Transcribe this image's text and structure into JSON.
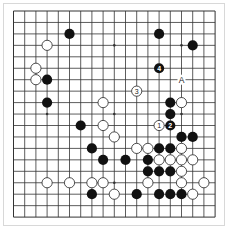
{
  "diagram": {
    "type": "go-board",
    "size": 19,
    "grid": {
      "x0": 13.5,
      "y0": 11,
      "dx": 11.2,
      "dy": 11.45
    },
    "colors": {
      "line": "#333333",
      "black": "#111111",
      "white": "#ffffff",
      "stroke": "#222222",
      "frame": "#d8d8d8"
    },
    "star_points": [
      [
        3,
        3
      ],
      [
        9,
        3
      ],
      [
        15,
        3
      ],
      [
        3,
        9
      ],
      [
        9,
        9
      ],
      [
        15,
        9
      ],
      [
        3,
        15
      ],
      [
        9,
        15
      ],
      [
        15,
        15
      ]
    ],
    "black_stones": [
      {
        "c": 5,
        "r": 2
      },
      {
        "c": 13,
        "r": 2
      },
      {
        "c": 16,
        "r": 3
      },
      {
        "c": 13,
        "r": 5,
        "label": "4"
      },
      {
        "c": 3,
        "r": 6
      },
      {
        "c": 3,
        "r": 8
      },
      {
        "c": 14,
        "r": 8
      },
      {
        "c": 14,
        "r": 9
      },
      {
        "c": 6,
        "r": 10
      },
      {
        "c": 14,
        "r": 10,
        "label": "2"
      },
      {
        "c": 15,
        "r": 11
      },
      {
        "c": 16,
        "r": 11
      },
      {
        "c": 7,
        "r": 12
      },
      {
        "c": 13,
        "r": 12
      },
      {
        "c": 14,
        "r": 12
      },
      {
        "c": 8,
        "r": 13
      },
      {
        "c": 10,
        "r": 13
      },
      {
        "c": 12,
        "r": 13
      },
      {
        "c": 12,
        "r": 14
      },
      {
        "c": 13,
        "r": 14
      },
      {
        "c": 14,
        "r": 14
      },
      {
        "c": 7,
        "r": 16
      },
      {
        "c": 11,
        "r": 16
      },
      {
        "c": 13,
        "r": 16
      },
      {
        "c": 14,
        "r": 16
      },
      {
        "c": 15,
        "r": 16
      }
    ],
    "white_stones": [
      {
        "c": 3,
        "r": 3
      },
      {
        "c": 2,
        "r": 5
      },
      {
        "c": 2,
        "r": 6
      },
      {
        "c": 11,
        "r": 7,
        "label": "3"
      },
      {
        "c": 8,
        "r": 8
      },
      {
        "c": 15,
        "r": 8
      },
      {
        "c": 8,
        "r": 10
      },
      {
        "c": 13,
        "r": 10,
        "label": "1"
      },
      {
        "c": 9,
        "r": 11
      },
      {
        "c": 11,
        "r": 12
      },
      {
        "c": 12,
        "r": 12
      },
      {
        "c": 15,
        "r": 12
      },
      {
        "c": 13,
        "r": 13
      },
      {
        "c": 14,
        "r": 13
      },
      {
        "c": 15,
        "r": 13
      },
      {
        "c": 16,
        "r": 13
      },
      {
        "c": 15,
        "r": 14
      },
      {
        "c": 3,
        "r": 15
      },
      {
        "c": 5,
        "r": 15
      },
      {
        "c": 7,
        "r": 15
      },
      {
        "c": 8,
        "r": 15
      },
      {
        "c": 12,
        "r": 15
      },
      {
        "c": 15,
        "r": 15
      },
      {
        "c": 17,
        "r": 15
      },
      {
        "c": 9,
        "r": 16
      },
      {
        "c": 16,
        "r": 16
      }
    ],
    "point_labels": [
      {
        "c": 15,
        "r": 6,
        "text": "A"
      }
    ]
  }
}
